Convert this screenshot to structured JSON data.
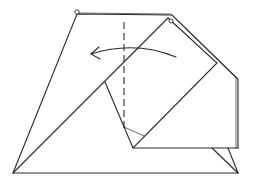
{
  "diagram": {
    "type": "origami-fold-step",
    "description": "Origami folding step: valley fold along the dashed line, folding the right flap to the left as shown by the curved arrow",
    "colors": {
      "line": "#2a2a2a",
      "background": "#ffffff"
    },
    "elements": {
      "valley_fold_line": "dashed vertical line",
      "fold_arrow": "curved arrow pointing left",
      "reference_points": [
        "circle at top-left corner",
        "circle at top-right inner corner"
      ]
    }
  }
}
